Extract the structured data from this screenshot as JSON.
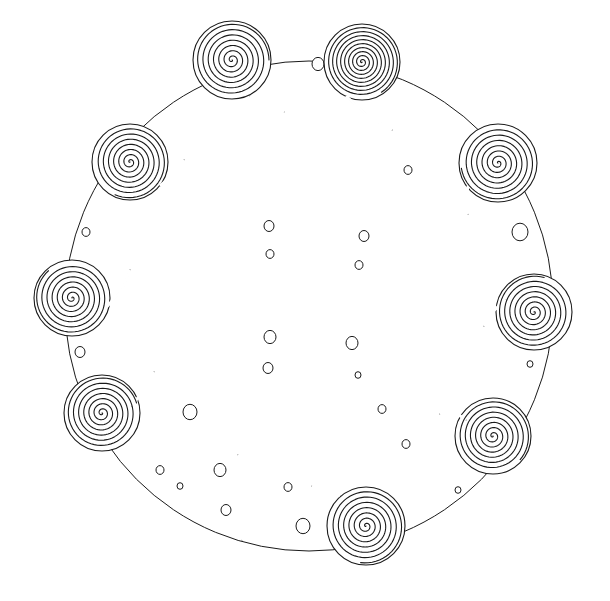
{
  "drawing": {
    "kind": "line drawing of spiral ornaments arranged on a circle",
    "background": "#ffffff",
    "stroke_color": "#1a1a1a",
    "outer_circle": {
      "cx": 309,
      "cy": 306,
      "rx": 244,
      "ry": 245
    },
    "spirals": [
      {
        "cx": 232,
        "cy": 60,
        "r": 38,
        "turns": 7,
        "tail": [
          [
            250,
            96
          ],
          [
            262,
            108
          ],
          [
            284,
            112
          ]
        ]
      },
      {
        "cx": 362,
        "cy": 62,
        "r": 37,
        "turns": 9,
        "tail": [
          [
            346,
            96
          ],
          [
            368,
            116
          ],
          [
            392,
            130
          ]
        ]
      },
      {
        "cx": 130,
        "cy": 162,
        "r": 37,
        "turns": 7,
        "tail": [
          [
            160,
            186
          ],
          [
            174,
            174
          ],
          [
            184,
            160
          ]
        ]
      },
      {
        "cx": 498,
        "cy": 163,
        "r": 38,
        "turns": 7,
        "tail": [
          [
            470,
            178
          ],
          [
            466,
            196
          ],
          [
            468,
            214
          ]
        ]
      },
      {
        "cx": 72,
        "cy": 298,
        "r": 37,
        "turns": 7,
        "tail": [
          [
            102,
            312
          ],
          [
            122,
            290
          ],
          [
            130,
            270
          ]
        ]
      },
      {
        "cx": 534,
        "cy": 312,
        "r": 37,
        "turns": 7,
        "tail": [
          [
            506,
            300
          ],
          [
            492,
            312
          ],
          [
            484,
            326
          ]
        ]
      },
      {
        "cx": 102,
        "cy": 413,
        "r": 37,
        "turns": 7,
        "tail": [
          [
            132,
            406
          ],
          [
            146,
            386
          ],
          [
            154,
            372
          ]
        ]
      },
      {
        "cx": 493,
        "cy": 436,
        "r": 37,
        "turns": 7,
        "tail": [
          [
            466,
            420
          ],
          [
            452,
            410
          ],
          [
            440,
            414
          ]
        ]
      },
      {
        "cx": 366,
        "cy": 526,
        "r": 38,
        "turns": 7,
        "tail": [
          [
            340,
            496
          ],
          [
            326,
            488
          ],
          [
            312,
            486
          ]
        ]
      }
    ],
    "beads": [
      {
        "x": 269,
        "y": 226,
        "r": 5
      },
      {
        "x": 270,
        "y": 254,
        "r": 4
      },
      {
        "x": 364,
        "y": 236,
        "r": 5
      },
      {
        "x": 359,
        "y": 265,
        "r": 4
      },
      {
        "x": 270,
        "y": 337,
        "r": 6
      },
      {
        "x": 268,
        "y": 368,
        "r": 5
      },
      {
        "x": 352,
        "y": 343,
        "r": 6
      },
      {
        "x": 358,
        "y": 375,
        "r": 3
      },
      {
        "x": 86,
        "y": 232,
        "r": 4
      },
      {
        "x": 408,
        "y": 170,
        "r": 4
      },
      {
        "x": 530,
        "y": 364,
        "r": 3
      },
      {
        "x": 382,
        "y": 409,
        "r": 4
      },
      {
        "x": 406,
        "y": 444,
        "r": 4
      },
      {
        "x": 180,
        "y": 486,
        "r": 3
      },
      {
        "x": 288,
        "y": 487,
        "r": 4
      },
      {
        "x": 458,
        "y": 490,
        "r": 3
      },
      {
        "x": 318,
        "y": 64,
        "r": 6
      },
      {
        "x": 226,
        "y": 510,
        "r": 5
      },
      {
        "x": 303,
        "y": 526,
        "r": 7
      },
      {
        "x": 190,
        "y": 412,
        "r": 7
      },
      {
        "x": 520,
        "y": 232,
        "r": 8
      },
      {
        "x": 80,
        "y": 352,
        "r": 5
      },
      {
        "x": 160,
        "y": 470,
        "r": 4
      },
      {
        "x": 220,
        "y": 470,
        "r": 6
      }
    ],
    "rods": [
      {
        "points": [
          [
            238,
            455
          ],
          [
            250,
            470
          ],
          [
            254,
            495
          ],
          [
            250,
            520
          ],
          [
            242,
            540
          ]
        ]
      }
    ]
  }
}
